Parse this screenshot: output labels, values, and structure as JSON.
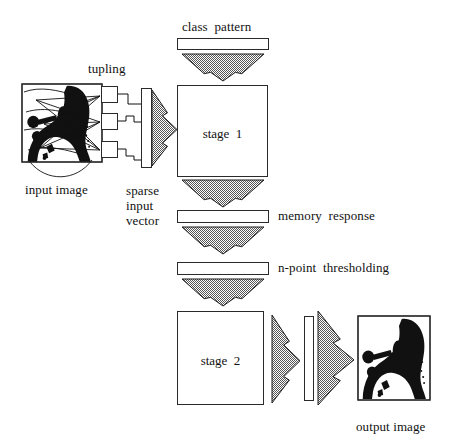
{
  "diagram": {
    "stroke_color": "#2a2a2a",
    "fill_color": "#ffffff",
    "arrow_fill": "#a8a8a8",
    "text_color": "#111111"
  },
  "labels": {
    "class_pattern": "class  pattern",
    "tupling": "tupling",
    "input_image": "input image",
    "sparse_input_vector": "sparse\ninput\nvector",
    "stage_1": "stage  1",
    "memory_response": "memory  response",
    "n_point_thresholding": "n-point  thresholding",
    "stage_2": "stage  2",
    "output_image": "output image"
  },
  "blocks": [
    {
      "name": "class-pattern-bar",
      "x": 177,
      "y": 38,
      "w": 92,
      "h": 12
    },
    {
      "name": "stage-1-box",
      "x": 177,
      "y": 85,
      "w": 91,
      "h": 92
    },
    {
      "name": "memory-response-bar",
      "x": 177,
      "y": 210,
      "w": 92,
      "h": 13
    },
    {
      "name": "n-point-thresholding-bar",
      "x": 177,
      "y": 262,
      "w": 92,
      "h": 13
    },
    {
      "name": "stage-2-box",
      "x": 177,
      "y": 311,
      "w": 87,
      "h": 94
    },
    {
      "name": "sparse-input-vector-bar",
      "x": 141,
      "y": 88,
      "w": 11,
      "h": 80
    },
    {
      "name": "intermediate-vector-bar",
      "x": 304,
      "y": 316,
      "w": 10,
      "h": 85
    },
    {
      "name": "tuple-box-1",
      "x": 101,
      "y": 86,
      "w": 17,
      "h": 17
    },
    {
      "name": "tuple-box-2",
      "x": 101,
      "y": 113,
      "w": 17,
      "h": 17
    },
    {
      "name": "tuple-box-3",
      "x": 101,
      "y": 141,
      "w": 17,
      "h": 17
    }
  ],
  "down_arrows": [
    {
      "name": "arrow-class-to-stage1",
      "cx": 223,
      "top": 54,
      "halfw": 41,
      "h": 27
    },
    {
      "name": "arrow-stage1-to-memory",
      "cx": 223,
      "top": 180,
      "halfw": 41,
      "h": 27
    },
    {
      "name": "arrow-memory-to-threshold",
      "cx": 223,
      "top": 227,
      "halfw": 41,
      "h": 27
    },
    {
      "name": "arrow-threshold-to-stage2",
      "cx": 223,
      "top": 279,
      "halfw": 41,
      "h": 27
    }
  ],
  "right_arrows": [
    {
      "name": "arrow-sparse-to-stage1",
      "x": 152,
      "y": 90,
      "w": 25,
      "h": 76
    },
    {
      "name": "arrow-stage2-to-vector",
      "x": 272,
      "y": 315,
      "w": 28,
      "h": 88
    },
    {
      "name": "arrow-vector-to-output",
      "x": 318,
      "y": 311,
      "w": 36,
      "h": 94
    }
  ],
  "images": [
    {
      "name": "input-photo",
      "x": 22,
      "y": 84,
      "w": 80,
      "h": 78
    },
    {
      "name": "output-photo",
      "x": 358,
      "y": 316,
      "w": 72,
      "h": 84
    }
  ],
  "label_positions": {
    "class_pattern": {
      "x": 182,
      "y": 20
    },
    "tupling": {
      "x": 88,
      "y": 62
    },
    "input_image": {
      "x": 25,
      "y": 183
    },
    "sparse_input_vector": {
      "x": 126,
      "y": 183
    },
    "memory_response": {
      "x": 278,
      "y": 209
    },
    "n_point_thresholding": {
      "x": 278,
      "y": 261
    },
    "output_image": {
      "x": 356,
      "y": 420
    }
  }
}
